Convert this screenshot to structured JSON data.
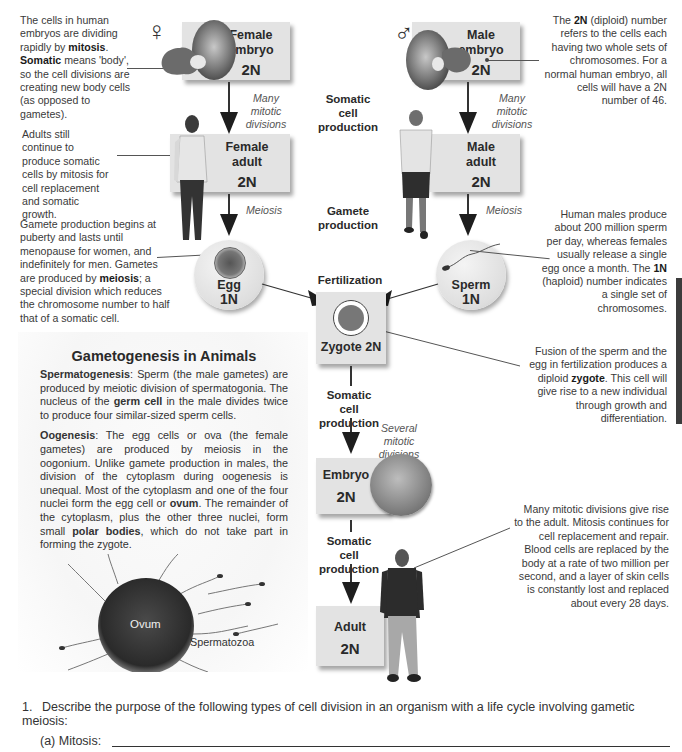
{
  "notes": {
    "embryo_note": {
      "pre": "The cells in human embryos are dividing rapidly by ",
      "b1": "mitosis",
      "mid": ". ",
      "b2": "Somatic",
      "post": " means 'body', so the cell divisions are creating new body cells (as opposed to gametes)."
    },
    "adult_note": "Adults still continue to produce somatic cells by mitosis for cell replacement and somatic growth.",
    "gamete_note": {
      "pre": "Gamete production begins at puberty and lasts until menopause for women, and indefinitely for men. Gametes are produced by ",
      "b1": "meiosis",
      "post": "; a special division which reduces the chromosome number to half that of a somatic cell."
    },
    "diploid_note": {
      "pre": "The ",
      "b1": "2N",
      "post": " (diploid) number refers to the cells each having two whole sets of chromosomes.  For a normal human embryo, all cells will have a 2N number of 46."
    },
    "sperm_note": {
      "pre": "Human males produce about 200 million sperm per day, whereas females usually release a single egg once a month. The ",
      "b1": "1N",
      "post": " (haploid) number indicates a single set of chromosomes."
    },
    "zygote_note": {
      "pre": "Fusion of the sperm and the egg in fertilization produces a diploid ",
      "b1": "zygote",
      "post": ". This cell will give rise to a new individual through growth and differentiation."
    },
    "adult_mitosis_note": "Many mitotic divisions give rise to the adult. Mitosis continues for cell replacement and repair. Blood cells are replaced by the body at a rate of two million per second, and a layer of skin cells is constantly lost and replaced about every 28 days."
  },
  "symbols": {
    "female": "♀",
    "male": "♂"
  },
  "boxes": {
    "female_embryo": {
      "label1": "Female",
      "label2": "embryo",
      "ploidy": "2N"
    },
    "female_adult": {
      "label1": "Female",
      "label2": "adult",
      "ploidy": "2N"
    },
    "male_embryo": {
      "label1": "Male",
      "label2": "embryo",
      "ploidy": "2N"
    },
    "male_adult": {
      "label1": "Male",
      "label2": "adult",
      "ploidy": "2N"
    },
    "egg": {
      "label": "Egg",
      "ploidy": "1N"
    },
    "sperm": {
      "label": "Sperm",
      "ploidy": "1N"
    },
    "zygote": {
      "label": "Zygote 2N"
    },
    "embryo": {
      "label": "Embryo",
      "ploidy": "2N"
    },
    "adult": {
      "label": "Adult",
      "ploidy": "2N"
    }
  },
  "stages": {
    "somatic1": "Somatic cell production",
    "gamete": "Gamete production",
    "fertilization": "Fertilization",
    "somatic2": "Somatic cell production",
    "somatic3": "Somatic cell production"
  },
  "arrow_labels": {
    "female_mitotic": "Many mitotic divisions",
    "male_mitotic": "Many mitotic divisions",
    "female_meiosis": "Meiosis",
    "male_meiosis": "Meiosis",
    "several_mitotic": "Several mitotic divisions"
  },
  "gametogenesis": {
    "title": "Gametogenesis in Animals",
    "sperm_para": {
      "b1": "Spermatogenesis",
      "t1": ": Sperm (the male gametes) are produced by meiotic division of spermatogonia. The nucleus of the ",
      "b2": "germ cell",
      "t2": " in the male divides twice to produce four similar-sized sperm cells."
    },
    "oo_para": {
      "b1": "Oogenesis",
      "t1": ": The egg cells or ova (the female gametes) are produced by meiosis in the oogonium. Unlike gamete production in males, the division of the cytoplasm during oogenesis is unequal. Most of the cytoplasm and one of the four nuclei form the egg cell or ",
      "b2": "ovum",
      "t2": ". The remainder of the cytoplasm, plus the other three nuclei, form small ",
      "b3": "polar bodies",
      "t3": ", which do not take part in forming the zygote."
    },
    "ovum_label": "Ovum",
    "spermatozoa_label": "Spermatozoa"
  },
  "question": {
    "number": "1.",
    "text": "Describe the purpose of the following types of cell division in an organism with a life cycle involving gametic meiosis:",
    "part_a": "(a) Mitosis:",
    "answer_a": ""
  }
}
